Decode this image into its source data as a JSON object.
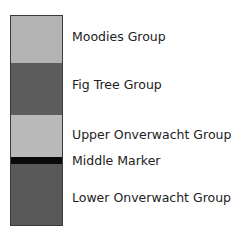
{
  "diagram": {
    "type": "stratigraphic-column",
    "layers": [
      {
        "name": "Moodies Group",
        "color": "#b4b4b4",
        "top": 0,
        "height": 47
      },
      {
        "name": "Fig Tree Group",
        "color": "#5c5c5c",
        "top": 47,
        "height": 52
      },
      {
        "name": "Upper Onverwacht Group",
        "color": "#b9b9b9",
        "top": 99,
        "height": 42
      },
      {
        "name": "Middle Marker",
        "color": "#0a0a0a",
        "top": 141,
        "height": 7
      },
      {
        "name": "Lower Onverwacht Group",
        "color": "#595959",
        "top": 148,
        "height": 63
      }
    ],
    "labels": [
      {
        "text": "Moodies Group",
        "y": 29
      },
      {
        "text": "Fig Tree Group",
        "y": 77
      },
      {
        "text": "Upper Onverwacht Group",
        "y": 127
      },
      {
        "text": "Middle Marker",
        "y": 153
      },
      {
        "text": "Lower Onverwacht Group",
        "y": 190
      }
    ]
  }
}
